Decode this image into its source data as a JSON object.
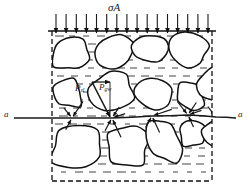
{
  "figure": {
    "title_label": "σA",
    "section_line_left_label": "a",
    "section_line_right_label": "a",
    "force_labels": {
      "tangential": {
        "base": "P",
        "sub": "sl"
      },
      "normal": {
        "base": "P",
        "sub": "gw"
      }
    },
    "colors": {
      "ink": "#1a1a1a",
      "grain_fill": "#ffffff",
      "grain_stroke": "#111111",
      "water_hatch": "#555555",
      "boundary": "#111111",
      "background": "#ffffff"
    },
    "geometry": {
      "width": 250,
      "height": 196,
      "container": {
        "x": 52,
        "y": 31,
        "w": 160,
        "h": 150
      },
      "top_load_arrow_count": 16,
      "top_arrow_y_start": 14,
      "top_arrow_y_end": 33,
      "section_line_y": 118
    },
    "grains": [
      {
        "name": "grain-top-left",
        "cx": 72,
        "cy": 54,
        "rx": 20,
        "ry": 17,
        "rot": -18,
        "seed": 11
      },
      {
        "name": "grain-top-mid-left",
        "cx": 114,
        "cy": 52,
        "rx": 22,
        "ry": 18,
        "rot": 12,
        "seed": 23
      },
      {
        "name": "grain-top-mid",
        "cx": 153,
        "cy": 48,
        "rx": 20,
        "ry": 15,
        "rot": -8,
        "seed": 31
      },
      {
        "name": "grain-top-right",
        "cx": 190,
        "cy": 50,
        "rx": 19,
        "ry": 15,
        "rot": 20,
        "seed": 41
      },
      {
        "name": "grain-mid-left",
        "cx": 68,
        "cy": 94,
        "rx": 16,
        "ry": 14,
        "rot": 9,
        "seed": 53
      },
      {
        "name": "grain-mid-center",
        "cx": 112,
        "cy": 90,
        "rx": 23,
        "ry": 19,
        "rot": -14,
        "seed": 67
      },
      {
        "name": "grain-mid-right",
        "cx": 156,
        "cy": 93,
        "rx": 20,
        "ry": 16,
        "rot": 16,
        "seed": 71
      },
      {
        "name": "grain-mid-far-right",
        "cx": 190,
        "cy": 96,
        "rx": 15,
        "ry": 14,
        "rot": -5,
        "seed": 83
      },
      {
        "name": "grain-right-edge",
        "cx": 212,
        "cy": 84,
        "rx": 14,
        "ry": 17,
        "rot": 25,
        "seed": 97
      },
      {
        "name": "grain-low-left",
        "cx": 78,
        "cy": 148,
        "rx": 28,
        "ry": 22,
        "rot": -10,
        "seed": 101
      },
      {
        "name": "grain-low-center",
        "cx": 128,
        "cy": 146,
        "rx": 22,
        "ry": 20,
        "rot": 14,
        "seed": 113
      },
      {
        "name": "grain-low-mid",
        "cx": 165,
        "cy": 140,
        "rx": 16,
        "ry": 22,
        "rot": -20,
        "seed": 127
      },
      {
        "name": "grain-low-right",
        "cx": 193,
        "cy": 134,
        "rx": 15,
        "ry": 14,
        "rot": 7,
        "seed": 139
      },
      {
        "name": "grain-low-far-right",
        "cx": 214,
        "cy": 133,
        "rx": 12,
        "ry": 14,
        "rot": -12,
        "seed": 149
      }
    ],
    "contacts": [
      {
        "name": "contact-1",
        "x": 72,
        "y": 118
      },
      {
        "name": "contact-2",
        "x": 112,
        "y": 118
      },
      {
        "name": "contact-3",
        "x": 152,
        "y": 116
      },
      {
        "name": "contact-4",
        "x": 188,
        "y": 115
      },
      {
        "name": "contact-5",
        "x": 216,
        "y": 117
      }
    ],
    "force_vectors": {
      "tangential_arrow": {
        "from_x": 92,
        "from_y": 82,
        "to_x": 110,
        "to_y": 82
      },
      "normal_arrow": {
        "from_x": 92,
        "from_y": 82,
        "to_x": 110,
        "to_y": 117
      }
    }
  }
}
